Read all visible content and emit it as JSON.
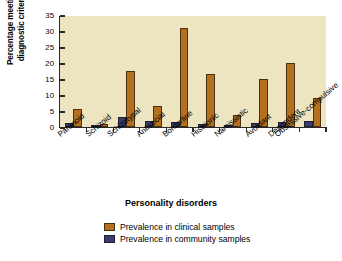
{
  "chart_data": {
    "type": "bar",
    "title": "",
    "xlabel": "Personality disorders",
    "ylabel": "Percentage meeting diagnostic criteria",
    "ylim": [
      0,
      35
    ],
    "yticks": [
      0,
      5,
      10,
      15,
      20,
      25,
      30,
      35
    ],
    "grid": false,
    "legend_position": "bottom-center",
    "categories": [
      "Paranoid",
      "Schizoid",
      "Schizotypal",
      "Antisocial",
      "Borderline",
      "Histrionic",
      "Narcissistic",
      "Avoidant",
      "Dependent",
      "Obsessive-compulsive"
    ],
    "series": [
      {
        "name": "Prevalence in community samples",
        "color": "#3b3d6b",
        "values": [
          1.3,
          0.6,
          3.0,
          1.8,
          1.6,
          1.0,
          0.4,
          1.2,
          1.5,
          1.8
        ]
      },
      {
        "name": "Prevalence in clinical samples",
        "color": "#b5701f",
        "values": [
          5.7,
          1.0,
          17.5,
          6.5,
          31.0,
          16.5,
          3.6,
          15.0,
          20.0,
          9.0
        ]
      }
    ]
  },
  "axes": {
    "y_title_line1": "Percentage meeting",
    "y_title_line2": "diagnostic criteria",
    "x_title": "Personality disorders"
  },
  "legend": {
    "items": [
      {
        "label": "Prevalence in clinical samples",
        "color": "#b5701f"
      },
      {
        "label": "Prevalence in community samples",
        "color": "#3b3d6b"
      }
    ]
  }
}
